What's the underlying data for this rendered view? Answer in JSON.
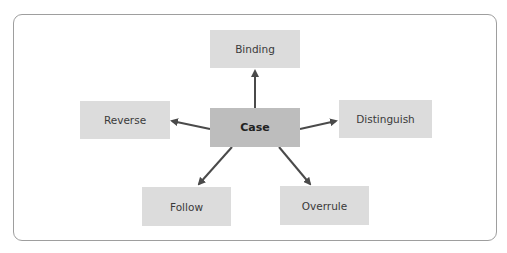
{
  "diagram": {
    "center": {
      "label": "Case"
    },
    "nodes": [
      {
        "id": "binding",
        "label": "Binding"
      },
      {
        "id": "reverse",
        "label": "Reverse"
      },
      {
        "id": "distinguish",
        "label": "Distinguish"
      },
      {
        "id": "follow",
        "label": "Follow"
      },
      {
        "id": "overrule",
        "label": "Overrule"
      }
    ],
    "colors": {
      "node_fill": "#dcdcdc",
      "center_fill": "#bdbdbd",
      "arrow": "#4a4a4a",
      "frame_border": "#9e9e9e"
    }
  }
}
